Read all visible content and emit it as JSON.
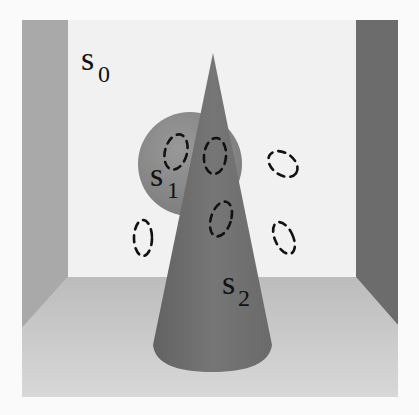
{
  "figure": {
    "labels": [
      {
        "id": "s0",
        "base": "s",
        "sub": "0"
      },
      {
        "id": "s1",
        "base": "s",
        "sub": "1"
      },
      {
        "id": "s2",
        "base": "s",
        "sub": "2"
      }
    ],
    "colors": {
      "background": "#fafafa",
      "back_wall": "#f1f1f1",
      "left_wall": "#a9a9a9",
      "right_wall": "#6c6c6c",
      "floor_top": "#bdbdbd",
      "floor_bottom": "#d6d6d6",
      "sphere": "#8c8c8c",
      "cone": "#717171",
      "dash": "#111111"
    },
    "dashed_regions_count": 7
  }
}
